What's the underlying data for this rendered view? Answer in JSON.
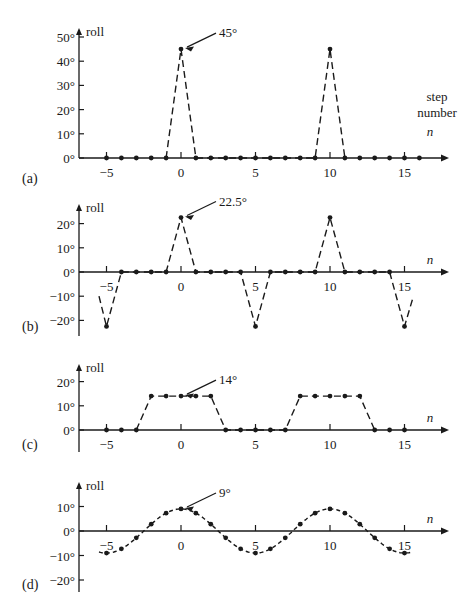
{
  "chart_data": [
    {
      "type": "line",
      "panel_label": "(a)",
      "title": "",
      "xlabel": "step number n",
      "xlabel_lines": [
        "step",
        "number",
        "n"
      ],
      "ylabel": "roll",
      "x_ticks": [
        -5,
        0,
        5,
        10,
        15
      ],
      "x_tick_labels": [
        "−5",
        "0",
        "5",
        "10",
        "15"
      ],
      "y_ticks": [
        0,
        10,
        20,
        30,
        40,
        50
      ],
      "y_tick_labels": [
        "0°",
        "10°",
        "20°",
        "30°",
        "40°",
        "50°"
      ],
      "ylim": [
        0,
        52
      ],
      "line_style": "dashed",
      "annotation": {
        "text": "45°",
        "x": 0,
        "y": 45
      },
      "series": [
        {
          "name": "roll",
          "x": [
            -5,
            -4,
            -3,
            -2,
            -1,
            0,
            1,
            2,
            3,
            4,
            5,
            6,
            7,
            8,
            9,
            10,
            11,
            12,
            13,
            14,
            15,
            16
          ],
          "values": [
            0,
            0,
            0,
            0,
            0,
            45,
            0,
            0,
            0,
            0,
            0,
            0,
            0,
            0,
            0,
            45,
            0,
            0,
            0,
            0,
            0,
            0
          ]
        }
      ],
      "layout": {
        "x0": 181,
        "unit": 14.9,
        "y0": 158,
        "px_per_deg": 2.42,
        "yaxis_x": 79,
        "yaxis_top": 28,
        "yaxis_bottom": 158,
        "xaxis_left": 79,
        "xaxis_right": 449,
        "label_x": 22,
        "label_y": 183,
        "line_from": -1,
        "line_to": 11
      }
    },
    {
      "type": "line",
      "panel_label": "(b)",
      "xlabel": "n",
      "ylabel": "roll",
      "x_ticks": [
        -5,
        0,
        5,
        10,
        15
      ],
      "x_tick_labels": [
        "−5",
        "0",
        "5",
        "10",
        "15"
      ],
      "y_ticks": [
        -20,
        -10,
        0,
        10,
        20
      ],
      "y_tick_labels": [
        "−20°",
        "−10°",
        "0°",
        "10°",
        "20°"
      ],
      "ylim": [
        -25,
        25
      ],
      "line_style": "dashed",
      "annotation": {
        "text": "22.5°",
        "x": 0,
        "y": 22.5
      },
      "series": [
        {
          "name": "roll",
          "x": [
            -5,
            -4,
            -3,
            -2,
            -1,
            0,
            1,
            2,
            3,
            4,
            5,
            6,
            7,
            8,
            9,
            10,
            11,
            12,
            13,
            14,
            15
          ],
          "values": [
            -22.5,
            0,
            0,
            0,
            0,
            22.5,
            0,
            0,
            0,
            0,
            -22.5,
            0,
            0,
            0,
            0,
            22.5,
            0,
            0,
            0,
            0,
            -22.5
          ]
        }
      ],
      "layout": {
        "x0": 181,
        "unit": 14.9,
        "y0": 272,
        "px_per_deg": 2.42,
        "yaxis_x": 79,
        "yaxis_top": 204,
        "yaxis_bottom": 336,
        "xaxis_left": 79,
        "xaxis_right": 449,
        "label_x": 22,
        "label_y": 331,
        "line_from": -5.5,
        "line_to": 15.6,
        "start_val": -10,
        "end_val": -10
      }
    },
    {
      "type": "line",
      "panel_label": "(c)",
      "xlabel": "n",
      "ylabel": "roll",
      "x_ticks": [
        -5,
        0,
        5,
        10,
        15
      ],
      "x_tick_labels": [
        "−5",
        "0",
        "5",
        "10",
        "15"
      ],
      "y_ticks": [
        0,
        10,
        20
      ],
      "y_tick_labels": [
        "0°",
        "10°",
        "20°"
      ],
      "ylim": [
        -8,
        22
      ],
      "line_style": "dashed",
      "annotation": {
        "text": "14°",
        "x": 0,
        "y": 14
      },
      "series": [
        {
          "name": "roll",
          "x": [
            -5,
            -4,
            -3,
            -2,
            -1,
            0,
            1,
            2,
            3,
            4,
            5,
            6,
            7,
            8,
            9,
            10,
            11,
            12,
            13,
            14,
            15
          ],
          "values": [
            0,
            0,
            0,
            14,
            14,
            14,
            14,
            14,
            0,
            0,
            0,
            0,
            0,
            14,
            14,
            14,
            14,
            14,
            0,
            0,
            0
          ]
        }
      ],
      "layout": {
        "x0": 181,
        "unit": 14.9,
        "y0": 430,
        "px_per_deg": 2.42,
        "yaxis_x": 79,
        "yaxis_top": 364,
        "yaxis_bottom": 452,
        "xaxis_left": 79,
        "xaxis_right": 449,
        "label_x": 22,
        "label_y": 449,
        "line_from": -3,
        "line_to": 13
      }
    },
    {
      "type": "line",
      "panel_label": "(d)",
      "xlabel": "n",
      "ylabel": "roll",
      "x_ticks": [
        -5,
        0,
        5,
        10,
        15
      ],
      "x_tick_labels": [
        "−5",
        "0",
        "5",
        "10",
        "15"
      ],
      "y_ticks": [
        -20,
        -10,
        0,
        10
      ],
      "y_tick_labels": [
        "−20°",
        "−10°",
        "0°",
        "10°"
      ],
      "ylim": [
        -22,
        12
      ],
      "line_style": "dashed",
      "annotation": {
        "text": "9°",
        "x": 0,
        "y": 9
      },
      "series": [
        {
          "name": "roll",
          "x": [
            -5,
            -4,
            -3,
            -2,
            -1,
            0,
            1,
            2,
            3,
            4,
            5,
            6,
            7,
            8,
            9,
            10,
            11,
            12,
            13,
            14,
            15
          ],
          "values": [
            -9,
            -7.28,
            -2.78,
            2.78,
            7.28,
            9,
            7.28,
            2.78,
            -2.78,
            -7.28,
            -9,
            -7.28,
            -2.78,
            2.78,
            7.28,
            9,
            7.28,
            2.78,
            -2.78,
            -7.28,
            -9
          ]
        }
      ],
      "layout": {
        "x0": 181,
        "unit": 14.9,
        "y0": 531,
        "px_per_deg": 2.45,
        "yaxis_x": 79,
        "yaxis_top": 482,
        "yaxis_bottom": 592,
        "xaxis_left": 79,
        "xaxis_right": 449,
        "label_x": 22,
        "label_y": 589,
        "smooth": true,
        "line_from": -5.5,
        "line_to": 15.5
      }
    }
  ]
}
